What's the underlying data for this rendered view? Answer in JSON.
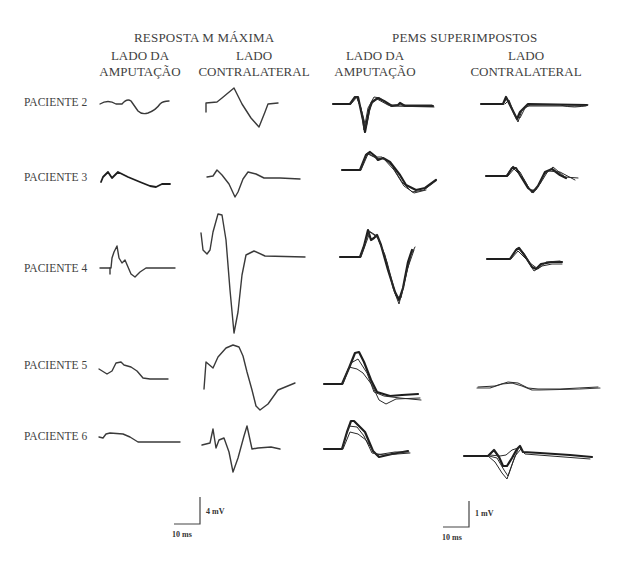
{
  "headers": {
    "group_left": "RESPOSTA M MÁXIMA",
    "group_right": "PEMS SUPERIMPOSTOS",
    "columns": [
      {
        "line1": "LADO DA",
        "line2": "AMPUTAÇÃO"
      },
      {
        "line1": "LADO",
        "line2": "CONTRALATERAL"
      },
      {
        "line1": "LADO DA",
        "line2": "AMPUTAÇÃO"
      },
      {
        "line1": "LADO",
        "line2": "CONTRALATERAL"
      }
    ]
  },
  "patients": [
    {
      "label": "PACIENTE 2"
    },
    {
      "label": "PACIENTE 3"
    },
    {
      "label": "PACIENTE 4"
    },
    {
      "label": "PACIENTE 5"
    },
    {
      "label": "PACIENTE 6"
    }
  ],
  "scale_bars": {
    "left": {
      "voltage": "4 mV",
      "time": "10 ms"
    },
    "right": {
      "voltage": "1 mV",
      "time": "10 ms"
    }
  },
  "colors": {
    "trace": "#3a3a3a",
    "background": "#ffffff",
    "text": "#3f3f3f"
  }
}
